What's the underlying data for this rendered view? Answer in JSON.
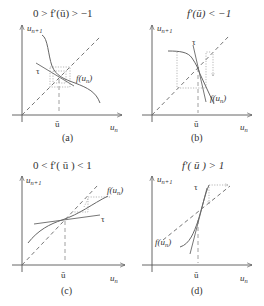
{
  "figure": {
    "panels": [
      {
        "id": "a",
        "caption": "(a)",
        "condition": "0 > f′(ū) > −1",
        "y_axis_label": "u",
        "y_axis_sub": "n+1",
        "x_axis_label": "u",
        "x_axis_sub": "n",
        "fixed_point_label": "ū",
        "tangent_label": "τ",
        "curve_label_f": "f(u",
        "curve_label_sub": "n",
        "curve_label_close": ")"
      },
      {
        "id": "b",
        "caption": "(b)",
        "condition": "f′(ū) < −1",
        "y_axis_label": "u",
        "y_axis_sub": "n+1",
        "x_axis_label": "u",
        "x_axis_sub": "n",
        "fixed_point_label": "ū",
        "tangent_label": "τ",
        "curve_label_f": "f(u",
        "curve_label_sub": "n",
        "curve_label_close": ")"
      },
      {
        "id": "c",
        "caption": "(c)",
        "condition": "0 < f′( ū ) < 1",
        "y_axis_label": "u",
        "y_axis_sub": "n+1",
        "x_axis_label": "u",
        "x_axis_sub": "n",
        "fixed_point_label": "ū",
        "tangent_label": "τ",
        "curve_label_f": "f(u",
        "curve_label_sub": "n",
        "curve_label_close": ")"
      },
      {
        "id": "d",
        "caption": "(d)",
        "condition": "f′( ū ) > 1",
        "y_axis_label": "u",
        "y_axis_sub": "n+1",
        "x_axis_label": "u",
        "x_axis_sub": "n",
        "fixed_point_label": "ū",
        "tangent_label": "τ",
        "curve_label_f": "f(u",
        "curve_label_sub": "n",
        "curve_label_close": ")"
      }
    ]
  }
}
